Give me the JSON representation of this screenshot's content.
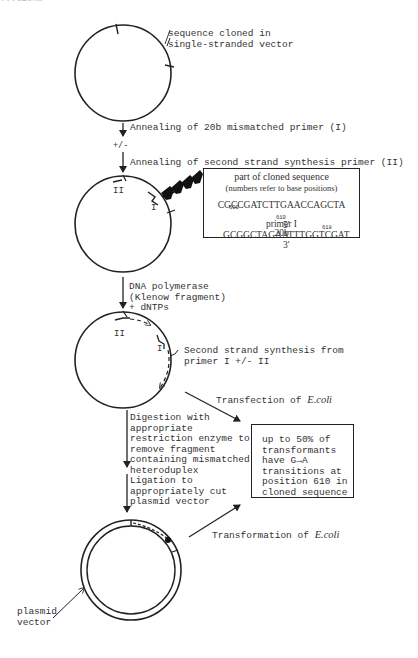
{
  "figure": {
    "clipped_header": "...tions",
    "steps": {
      "step1_label": "sequence cloned in\nsingle-stranded vector",
      "step2_label": "Annealing of 20b mismatched primer (I)",
      "optional_marker": "+/-",
      "step3_label": "Annealing of second strand synthesis primer (II)",
      "step4_label": "DNA polymerase\n(Klenow fragment)\n+ dNTPs",
      "step5_label": "Second strand synthesis from\nprimer I +/- II",
      "step6_label": "Digestion with\nappropriate\nrestriction enzyme to\nremove fragment\ncontaining mismatched\nheteroduplex",
      "step7_label": "Ligation to\nappropriately cut\nplasmid vector",
      "transfection_label_prefix": "Transfection of ",
      "transformation_label_prefix": "Transformation of ",
      "organism": "E.coli",
      "plasmid_label": "plasmid\nvector"
    },
    "circle_labels": {
      "primer_two": "II",
      "primer_one": "I"
    },
    "sequence_box": {
      "title": "part of cloned sequence",
      "subtitle": "(numbers refer to base positions)",
      "positions": [
        "600",
        "610",
        "618"
      ],
      "top_strand": "CGCCGATCTTGAACCAGCTA",
      "bottom_strand_prefix": "5'",
      "bottom_strand": "GCGGCTAGAATTTGGTCGAT",
      "bottom_strand_suffix": "3'",
      "primer_label": "primer I",
      "primer_length": "20b"
    },
    "result_box": {
      "lines": [
        "up to 50% of",
        "transformants",
        "have G→A",
        "transitions at",
        "position 610 in",
        "cloned sequence"
      ]
    }
  }
}
